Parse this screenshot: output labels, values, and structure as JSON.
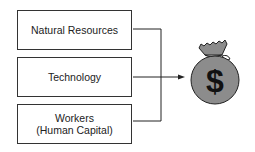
{
  "diagram": {
    "inputs": [
      {
        "label": "Natural Resources"
      },
      {
        "label": "Technology"
      },
      {
        "label": "Workers\n(Human Capital)",
        "line1": "Workers",
        "line2": "(Human Capital)"
      }
    ],
    "output": {
      "icon": "money-bag-icon",
      "symbol": "$"
    },
    "colors": {
      "bag_fill": "#8c8c8c",
      "stroke": "#222222"
    }
  }
}
